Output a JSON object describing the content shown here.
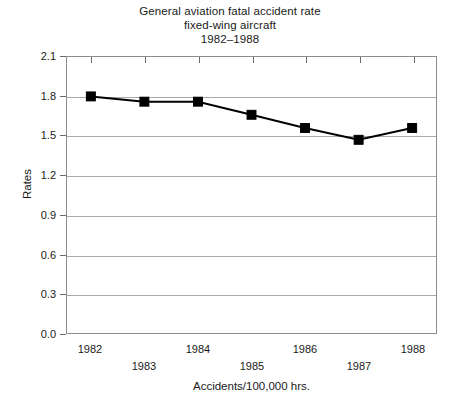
{
  "title": {
    "line1": "General aviation fatal accident rate",
    "line2": "fixed-wing aircraft",
    "line3": "1982–1988"
  },
  "axes": {
    "ylabel": "Rates",
    "xlabel": "Accidents/100,000 hrs.",
    "yticks": [
      "0.0",
      "0.3",
      "0.6",
      "0.9",
      "1.2",
      "1.5",
      "1.8",
      "2.1"
    ],
    "xticks": [
      "1982",
      "1983",
      "1984",
      "1985",
      "1986",
      "1987",
      "1988"
    ]
  },
  "chart_data": {
    "type": "line",
    "xlabel": "Accidents/100,000 hrs.",
    "ylabel": "Rates",
    "categories": [
      "1982",
      "1983",
      "1984",
      "1985",
      "1986",
      "1987",
      "1988"
    ],
    "x": [
      1982,
      1983,
      1984,
      1985,
      1986,
      1987,
      1988
    ],
    "values": [
      1.8,
      1.76,
      1.76,
      1.66,
      1.56,
      1.47,
      1.56
    ],
    "series": [
      {
        "name": "Fatal accident rate",
        "values": [
          1.8,
          1.76,
          1.76,
          1.66,
          1.56,
          1.47,
          1.56
        ]
      }
    ],
    "ylim": [
      0.0,
      2.1
    ],
    "ytick_step": 0.3,
    "yticks": [
      0.0,
      0.3,
      0.6,
      0.9,
      1.2,
      1.5,
      1.8,
      2.1
    ],
    "xtick_labels_staggered": true,
    "grid": "horizontal",
    "legend": "none",
    "marker": "filled-square",
    "line_color": "#000000",
    "grid_color": "#a9a9a9",
    "background_color": "#ffffff"
  }
}
